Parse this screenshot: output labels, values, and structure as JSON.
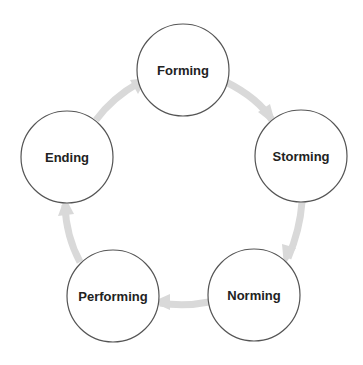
{
  "diagram": {
    "type": "cycle",
    "stages": [
      {
        "label": "Forming",
        "cx": 183,
        "cy": 70
      },
      {
        "label": "Storming",
        "cx": 301,
        "cy": 156
      },
      {
        "label": "Norming",
        "cx": 254,
        "cy": 295
      },
      {
        "label": "Performing",
        "cx": 113,
        "cy": 296
      },
      {
        "label": "Ending",
        "cx": 67,
        "cy": 157
      }
    ],
    "edges": [
      {
        "from": "Forming",
        "to": "Storming"
      },
      {
        "from": "Storming",
        "to": "Norming"
      },
      {
        "from": "Norming",
        "to": "Performing"
      },
      {
        "from": "Performing",
        "to": "Ending"
      },
      {
        "from": "Ending",
        "to": "Forming"
      }
    ],
    "colors": {
      "circle_stroke": "#555555",
      "text": "#222222",
      "arrow": "#d9d9d9",
      "background": "#ffffff"
    }
  }
}
